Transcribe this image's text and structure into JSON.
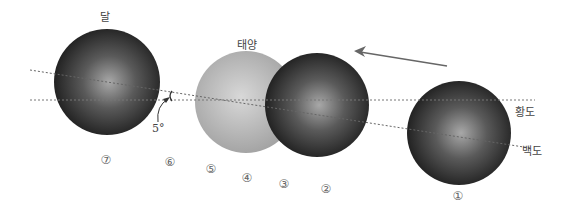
{
  "labels": {
    "moon": "달",
    "sun": "태양",
    "ecliptic": "황도",
    "lunar_path": "백도",
    "angle": "5°"
  },
  "positions": [
    "①",
    "②",
    "③",
    "④",
    "⑤",
    "⑥",
    "⑦"
  ],
  "colors": {
    "moon_dark": "#1e1e1e",
    "moon_light": "#9a9a9a",
    "sun_light": "#d4d4d4",
    "sun_dark": "#9c9c9c",
    "line": "#777777",
    "arrow": "#666666"
  },
  "icons": {
    "motion_arrow": "arrow-left"
  }
}
